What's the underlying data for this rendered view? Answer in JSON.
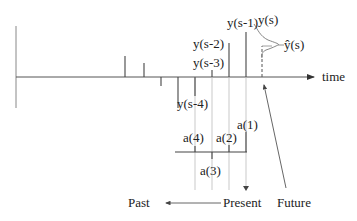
{
  "diagram": {
    "type": "time-series prediction schematic",
    "axis": {
      "label": "time"
    },
    "samples": {
      "y_s_minus_1": "y(s-1)",
      "y_s_minus_2": "y(s-2)",
      "y_s_minus_3": "y(s-3)",
      "y_s_minus_4": "y(s-4)",
      "y_s": "y(s)",
      "y_hat_s": "ŷ(s)"
    },
    "filter_coefficients": {
      "a1": "a(1)",
      "a2": "a(2)",
      "a3": "a(3)",
      "a4": "a(4)"
    },
    "time_regions": {
      "past": "Past",
      "present": "Present",
      "future": "Future"
    },
    "colors": {
      "line": "#333333",
      "guide": "#aaaaaa",
      "text": "#222222"
    }
  }
}
